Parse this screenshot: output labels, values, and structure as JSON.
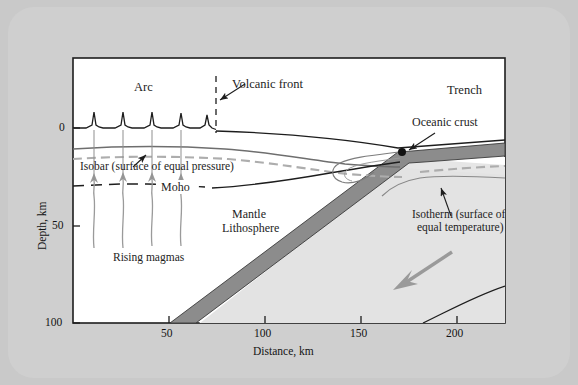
{
  "figure": {
    "type": "cross-section-diagram",
    "background_color": "#c9c9c9",
    "plot_background": "#ffffff"
  },
  "axes": {
    "x": {
      "title": "Distance, km",
      "ticks": [
        "50",
        "100",
        "150",
        "200"
      ],
      "tick_values": [
        50,
        100,
        150,
        200
      ],
      "range": [
        0,
        225
      ]
    },
    "y": {
      "title": "Depth, km",
      "ticks": [
        "0",
        "50",
        "100"
      ],
      "tick_values": [
        0,
        50,
        100
      ],
      "range": [
        0,
        110
      ],
      "direction": "downward"
    }
  },
  "labels": {
    "arc": "Arc",
    "volcanic_front": "Volcanic front",
    "trench": "Trench",
    "oceanic_crust": "Oceanic crust",
    "isobar": "Isobar (surface of equal pressure)",
    "moho": "Moho",
    "mantle": "Mantle",
    "lithosphere": "Lithosphere",
    "rising_magmas": "Rising magmas",
    "isotherm_line1": "Isotherm (surface of",
    "isotherm_line2": "equal temperature)"
  },
  "colors": {
    "slab": "#8c8c8c",
    "wedge_fill": "#e2e2e2",
    "isobar_line": "#a9a9a9",
    "arrow": "#9a9a9a",
    "outline": "#1d1d1d",
    "page": "#c9c9c9"
  },
  "features": {
    "volcano_count": 5,
    "volcano_x_px": [
      94,
      123,
      152,
      181,
      207
    ],
    "magma_arrow_count": 4,
    "subduction_arrow_direction": "down-left",
    "volcanic_front_x_km": 73,
    "slab_dip_degrees": 45
  }
}
